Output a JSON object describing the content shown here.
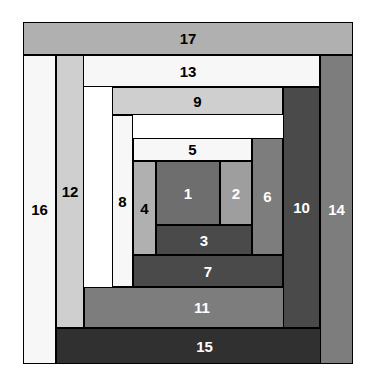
{
  "figure": {
    "name": "log-cabin-quilt-block-diagram",
    "background_color": "#ffffff",
    "block_outline_color": "#000000",
    "width": 372,
    "height": 382
  },
  "palette": {
    "white": "#f7f7f7",
    "very_light_gray": "#e3e3e3",
    "light_gray": "#cfcfcf",
    "medium_light_gray": "#b0b0b0",
    "medium_gray": "#9e9e9e",
    "medium_dark_gray": "#7d7d7d",
    "dark_gray": "#6e6e6e",
    "darker_gray": "#4a4a4a",
    "darkest_gray": "#303030",
    "outline": "#000000",
    "dark_label_text": "#000000",
    "light_label_text": "#ffffff"
  },
  "pieces": [
    {
      "id": "piece-1",
      "label": "1",
      "position": "center-left",
      "x": 156,
      "y": 161,
      "w": 64,
      "h": 64,
      "fill": "#6e6e6e",
      "label_color": "light"
    },
    {
      "id": "piece-2",
      "label": "2",
      "position": "center-right",
      "x": 220,
      "y": 161,
      "w": 32,
      "h": 64,
      "fill": "#9e9e9e",
      "label_color": "light"
    },
    {
      "id": "piece-3",
      "label": "3",
      "position": "bottom",
      "x": 156,
      "y": 225,
      "w": 96,
      "h": 30,
      "fill": "#4a4a4a",
      "label_color": "light"
    },
    {
      "id": "piece-4",
      "label": "4",
      "position": "left",
      "x": 133,
      "y": 161,
      "w": 23,
      "h": 94,
      "fill": "#b0b0b0",
      "label_color": "dark"
    },
    {
      "id": "piece-5",
      "label": "5",
      "position": "top",
      "x": 133,
      "y": 138,
      "w": 119,
      "h": 23,
      "fill": "#f7f7f7",
      "label_color": "dark"
    },
    {
      "id": "piece-6",
      "label": "6",
      "position": "right",
      "x": 252,
      "y": 138,
      "w": 31,
      "h": 117,
      "fill": "#7d7d7d",
      "label_color": "light"
    },
    {
      "id": "piece-7",
      "label": "7",
      "position": "bottom",
      "x": 133,
      "y": 255,
      "w": 150,
      "h": 32,
      "fill": "#4a4a4a",
      "label_color": "light"
    },
    {
      "id": "piece-8",
      "label": "8",
      "position": "left",
      "x": 112,
      "y": 115,
      "w": 21,
      "h": 172,
      "fill": "#f7f7f7",
      "label_color": "dark"
    },
    {
      "id": "piece-9",
      "label": "9",
      "position": "top",
      "x": 112,
      "y": 87,
      "w": 171,
      "h": 28,
      "fill": "#cfcfcf",
      "label_color": "dark"
    },
    {
      "id": "piece-10",
      "label": "10",
      "position": "right",
      "x": 283,
      "y": 87,
      "w": 37,
      "h": 241,
      "fill": "#4a4a4a",
      "label_color": "light"
    },
    {
      "id": "piece-11",
      "label": "11",
      "position": "bottom",
      "x": 84,
      "y": 287,
      "w": 236,
      "h": 41,
      "fill": "#7d7d7d",
      "label_color": "light"
    },
    {
      "id": "piece-12",
      "label": "12",
      "position": "left",
      "x": 56,
      "y": 55,
      "w": 28,
      "h": 273,
      "fill": "#cfcfcf",
      "label_color": "dark"
    },
    {
      "id": "piece-13",
      "label": "13",
      "position": "top",
      "x": 56,
      "y": 55,
      "w": 264,
      "h": 32,
      "fill": "#f7f7f7",
      "label_color": "dark"
    },
    {
      "id": "piece-14",
      "label": "14",
      "position": "right",
      "x": 320,
      "y": 55,
      "w": 33,
      "h": 309,
      "fill": "#7d7d7d",
      "label_color": "light"
    },
    {
      "id": "piece-15",
      "label": "15",
      "position": "bottom",
      "x": 56,
      "y": 328,
      "w": 297,
      "h": 36,
      "fill": "#303030",
      "label_color": "light"
    },
    {
      "id": "piece-16",
      "label": "16",
      "position": "left",
      "x": 23,
      "y": 55,
      "w": 33,
      "h": 309,
      "fill": "#f7f7f7",
      "label_color": "dark"
    },
    {
      "id": "piece-17",
      "label": "17",
      "position": "top",
      "x": 23,
      "y": 22,
      "w": 330,
      "h": 33,
      "fill": "#b0b0b0",
      "label_color": "dark"
    }
  ]
}
